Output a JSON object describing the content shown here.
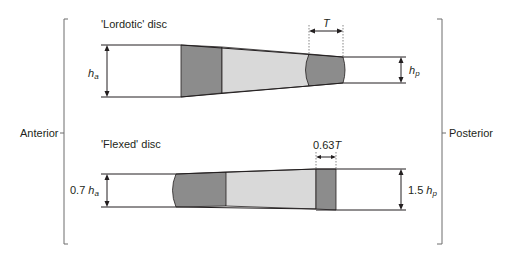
{
  "labels": {
    "anterior": "Anterior",
    "posterior": "Posterior",
    "lordotic_title": "'Lordotic' disc",
    "flexed_title": "'Flexed' disc",
    "h": "h",
    "sub_a": "a",
    "sub_p": "p",
    "T": "T",
    "flexed_T_coef": "0.63",
    "flexed_ha_coef": "0.7",
    "flexed_hp_coef": "1.5"
  },
  "colors": {
    "line": "#231f20",
    "nucleus": "#8c8c8c",
    "annulus_light": "#d9d9d9",
    "annulus_dark": "#8c8c8c",
    "bracket": "#6d6d6d"
  }
}
